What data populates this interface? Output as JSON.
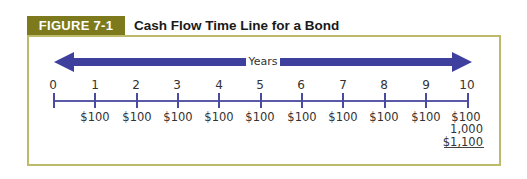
{
  "figure": {
    "label": "FIGURE 7-1",
    "title": "Cash Flow Time Line for a Bond",
    "label_bg_color": "#7d7a1e",
    "frame_color": "#bdbb6a",
    "arrow_color": "#3f3f9e"
  },
  "timeline": {
    "arrow_label": "Years",
    "periods": [
      "0",
      "1",
      "2",
      "3",
      "4",
      "5",
      "6",
      "7",
      "8",
      "9",
      "10"
    ],
    "cash_flows": [
      "",
      "$100",
      "$100",
      "$100",
      "$100",
      "$100",
      "$100",
      "$100",
      "$100",
      "$100",
      "$100"
    ],
    "final_principal": "1,000",
    "final_total": "$1,100"
  }
}
